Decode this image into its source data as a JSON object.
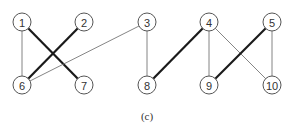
{
  "diagram": {
    "type": "bipartite-graph",
    "caption": "(c)",
    "node_radius": 9,
    "nodes": [
      {
        "id": "1",
        "label": "1",
        "x": 22,
        "y": 22
      },
      {
        "id": "2",
        "label": "2",
        "x": 84,
        "y": 22
      },
      {
        "id": "3",
        "label": "3",
        "x": 147,
        "y": 22
      },
      {
        "id": "4",
        "label": "4",
        "x": 209,
        "y": 22
      },
      {
        "id": "5",
        "label": "5",
        "x": 272,
        "y": 22
      },
      {
        "id": "6",
        "label": "6",
        "x": 22,
        "y": 85
      },
      {
        "id": "7",
        "label": "7",
        "x": 84,
        "y": 85
      },
      {
        "id": "8",
        "label": "8",
        "x": 147,
        "y": 85
      },
      {
        "id": "9",
        "label": "9",
        "x": 209,
        "y": 85
      },
      {
        "id": "10",
        "label": "10",
        "x": 272,
        "y": 85
      }
    ],
    "edges": [
      {
        "from": "1",
        "to": "6",
        "style": "thin"
      },
      {
        "from": "1",
        "to": "7",
        "style": "thick"
      },
      {
        "from": "2",
        "to": "6",
        "style": "thick"
      },
      {
        "from": "3",
        "to": "6",
        "style": "thin"
      },
      {
        "from": "3",
        "to": "8",
        "style": "thin"
      },
      {
        "from": "4",
        "to": "8",
        "style": "thick"
      },
      {
        "from": "4",
        "to": "9",
        "style": "thin"
      },
      {
        "from": "4",
        "to": "10",
        "style": "thin"
      },
      {
        "from": "5",
        "to": "9",
        "style": "thick"
      },
      {
        "from": "5",
        "to": "10",
        "style": "thin"
      }
    ],
    "colors": {
      "thin_edge": "#777777",
      "thick_edge": "#1a1a1a",
      "node_stroke": "#555555"
    }
  }
}
